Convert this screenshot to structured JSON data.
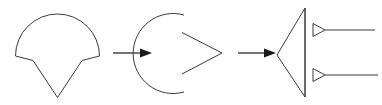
{
  "canvas": {
    "width": 382,
    "height": 105,
    "background": "#ffffff",
    "stroke_color": "#3a3a3a",
    "arrow_color": "#1a1a1a"
  },
  "diagram": {
    "title": "",
    "kind": "shape-transformation-sequence",
    "step_count": 3,
    "connector_count": 2
  },
  "shapes": [
    {
      "id": "shape-1",
      "name": "dome-with-v-notch",
      "description": "Dome arc with two side tabs and a downward V point",
      "geometry": {
        "arc_center_x": 57.5,
        "arc_center_y": 49,
        "arc_radius": 42,
        "arc_left_x": 15.5,
        "arc_right_x": 99.5,
        "arc_top_y": 7,
        "tab_left_outer_x": 15.5,
        "tab_left_outer_y": 56,
        "tab_left_inner_x": 33,
        "tab_left_inner_y": 60.5,
        "tab_right_inner_x": 82,
        "tab_right_inner_y": 60.5,
        "tab_right_outer_x": 99.5,
        "tab_right_outer_y": 56,
        "v_apex_x": 57.5,
        "v_apex_y": 97.5
      },
      "path": "M 15.5 56 A 42 42 0 1 1 99.5 56 L 99.5 56 L 82 60.5 L 57.5 97.5 L 33 60.5 L 15.5 56 Z"
    },
    {
      "id": "shape-2",
      "name": "open-arc-with-chevron",
      "description": "Left-bulging open arc beside a right-pointing chevron",
      "arc_path": "M 184 15 A 40 40 0 1 0 184 92",
      "chevron_path": "M 182 32.5 L 222 53 L 182 74",
      "geometry": {
        "arc_left_x": 159,
        "arc_top_y": 15,
        "arc_bottom_y": 92,
        "chevron_apex_x": 222,
        "chevron_apex_y": 53,
        "chevron_top_y": 32.5,
        "chevron_bottom_y": 74
      }
    },
    {
      "id": "shape-3",
      "name": "left-pointing-triangle-with-leaders",
      "description": "Tall left-pointing triangle with two leader lines ending in small hollow triangles",
      "triangle_path": "M 305 8 L 277 55 L 305 97 Z",
      "spine_path": "M 305 8 L 305 97",
      "geometry": {
        "spine_x": 305,
        "spine_top_y": 8,
        "spine_bottom_y": 97,
        "apex_x": 277,
        "apex_y": 55
      },
      "leaders": [
        {
          "id": "leader-top",
          "name": "leader-line-top",
          "marker_path": "M 313 23.5 L 325 30 L 313 36.5 Z",
          "line_path": "M 325 30 L 375 30",
          "y": 30,
          "line_end_x": 375
        },
        {
          "id": "leader-bottom",
          "name": "leader-line-bottom",
          "marker_path": "M 313 68.5 L 325 75 L 313 81.5 Z",
          "line_path": "M 325 75 L 378 75",
          "y": 75,
          "line_end_x": 378
        }
      ]
    }
  ],
  "connectors": [
    {
      "id": "arrow-1",
      "name": "transform-arrow-1",
      "label": "",
      "shaft_path": "M 113 53 L 140 53",
      "head_points": "140,48.5 152,53 140,57.5",
      "from": "shape-1",
      "to": "shape-2"
    },
    {
      "id": "arrow-2",
      "name": "transform-arrow-2",
      "label": "",
      "shaft_path": "M 238 53 L 264 53",
      "head_points": "264,48.5 276,53 264,57.5",
      "from": "shape-2",
      "to": "shape-3"
    }
  ]
}
